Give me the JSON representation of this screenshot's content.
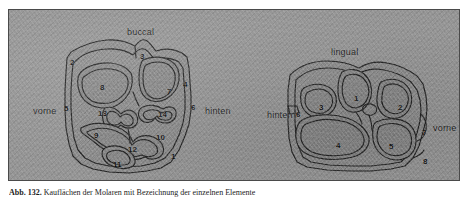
{
  "figure": {
    "caption_label": "Abb. 132.",
    "caption_text": "Kauflächen der Molaren mit Bezeichnung der einzelnen Elemente"
  },
  "plate": {
    "background_color": "#949494",
    "border_color": "#4a4a4a",
    "enamel_fill_color": "#8a8a8a",
    "outline_color": "#242424"
  },
  "left_tooth": {
    "name": "left-occlusal-surface",
    "direction_labels": [
      {
        "text": "buccal",
        "position": "top",
        "x": 118,
        "y": 17
      },
      {
        "text": "vorne",
        "position": "left",
        "x": 24,
        "y": 96
      },
      {
        "text": "hinten",
        "position": "right",
        "x": 196,
        "y": 96
      },
      {
        "text": "lingual",
        "position": "bottom",
        "x": 116,
        "y": 172
      }
    ],
    "numbers": [
      {
        "label": "1",
        "x": 162,
        "y": 143
      },
      {
        "label": "2",
        "x": 61,
        "y": 49
      },
      {
        "label": "3",
        "x": 131,
        "y": 43
      },
      {
        "label": "4",
        "x": 174,
        "y": 71
      },
      {
        "label": "5",
        "x": 55,
        "y": 95
      },
      {
        "label": "6",
        "x": 182,
        "y": 94
      },
      {
        "label": "7",
        "x": 158,
        "y": 78
      },
      {
        "label": "8",
        "x": 91,
        "y": 74
      },
      {
        "label": "9",
        "x": 85,
        "y": 122
      },
      {
        "label": "10",
        "x": 147,
        "y": 124
      },
      {
        "label": "11",
        "x": 104,
        "y": 151
      },
      {
        "label": "12",
        "x": 119,
        "y": 136
      },
      {
        "label": "13",
        "x": 89,
        "y": 100
      },
      {
        "label": "14",
        "x": 149,
        "y": 101
      }
    ]
  },
  "right_tooth": {
    "name": "right-occlusal-surface",
    "direction_labels": [
      {
        "text": "lingual",
        "position": "top",
        "x": 322,
        "y": 37
      },
      {
        "text": "hinten",
        "position": "left",
        "x": 258,
        "y": 100
      },
      {
        "text": "vorne",
        "position": "right",
        "x": 424,
        "y": 113
      },
      {
        "text": "buccal",
        "position": "bottom",
        "x": 336,
        "y": 172
      }
    ],
    "numbers": [
      {
        "label": "1",
        "x": 345,
        "y": 85
      },
      {
        "label": "2",
        "x": 389,
        "y": 94
      },
      {
        "label": "3",
        "x": 310,
        "y": 94
      },
      {
        "label": "4",
        "x": 327,
        "y": 132
      },
      {
        "label": "5",
        "x": 380,
        "y": 133
      },
      {
        "label": "6",
        "x": 287,
        "y": 101
      },
      {
        "label": "7",
        "x": 413,
        "y": 119
      },
      {
        "label": "8",
        "x": 414,
        "y": 148
      }
    ]
  }
}
